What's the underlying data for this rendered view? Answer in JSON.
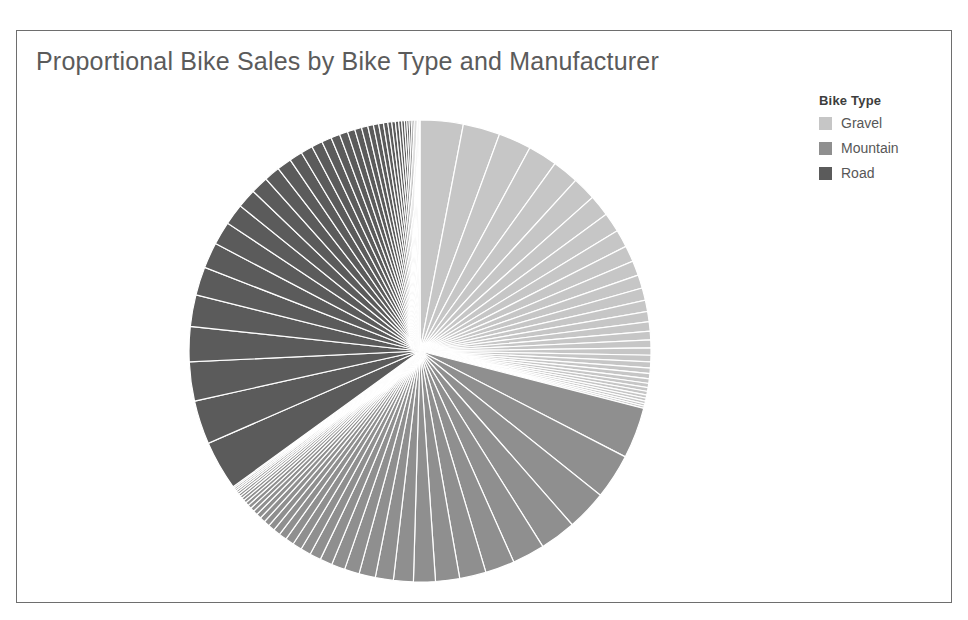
{
  "figure": {
    "title": "Proportional Bike Sales by Bike Type and Manufacturer",
    "frame_border_color": "#6e6e6e",
    "background_color": "#ffffff"
  },
  "legend": {
    "title": "Bike Type",
    "position": "right",
    "items": [
      {
        "label": "Gravel",
        "color": "#c6c6c6"
      },
      {
        "label": "Mountain",
        "color": "#8f8f8f"
      },
      {
        "label": "Road",
        "color": "#5b5b5b"
      }
    ]
  },
  "scan_artifacts": {
    "top_fragment": "",
    "bottom_fragment": ""
  },
  "chart_data": {
    "type": "pie",
    "title": "Proportional Bike Sales by Bike Type and Manufacturer",
    "xlabel": "",
    "ylabel": "",
    "legend_title": "Bike Type",
    "legend_position": "right",
    "grid": false,
    "start_angle_deg": 0,
    "direction": "clockwise",
    "wedge_edge_color": "#ffffff",
    "wedge_edge_width": 1.2,
    "groups": [
      {
        "name": "Gravel",
        "color": "#c6c6c6",
        "share_percent": 29.0,
        "slice_count": 32,
        "slice_percents": [
          3.05,
          2.62,
          2.33,
          2.07,
          1.86,
          1.68,
          1.52,
          1.38,
          1.25,
          1.14,
          1.04,
          0.95,
          0.87,
          0.8,
          0.73,
          0.67,
          0.61,
          0.56,
          0.51,
          0.47,
          0.43,
          0.39,
          0.36,
          0.33,
          0.3,
          0.27,
          0.25,
          0.23,
          0.21,
          0.19,
          0.17,
          0.16
        ]
      },
      {
        "name": "Mountain",
        "color": "#8f8f8f",
        "share_percent": 36.0,
        "slice_count": 38,
        "slice_percents": [
          3.4,
          3.0,
          2.68,
          2.4,
          2.16,
          1.95,
          1.76,
          1.6,
          1.45,
          1.32,
          1.2,
          1.09,
          0.99,
          0.9,
          0.82,
          0.75,
          0.68,
          0.62,
          0.57,
          0.52,
          0.47,
          0.43,
          0.39,
          0.36,
          0.33,
          0.3,
          0.27,
          0.25,
          0.23,
          0.21,
          0.19,
          0.17,
          0.16,
          0.15,
          0.13,
          0.12,
          0.11,
          0.1
        ]
      },
      {
        "name": "Road",
        "color": "#5b5b5b",
        "share_percent": 35.0,
        "slice_count": 40,
        "slice_percents": [
          3.3,
          2.92,
          2.61,
          2.34,
          2.11,
          1.9,
          1.72,
          1.56,
          1.41,
          1.28,
          1.17,
          1.06,
          0.97,
          0.88,
          0.8,
          0.73,
          0.66,
          0.6,
          0.55,
          0.5,
          0.46,
          0.42,
          0.38,
          0.35,
          0.32,
          0.29,
          0.26,
          0.24,
          0.22,
          0.2,
          0.18,
          0.16,
          0.15,
          0.14,
          0.12,
          0.11,
          0.1,
          0.09,
          0.08,
          0.08
        ]
      }
    ]
  }
}
